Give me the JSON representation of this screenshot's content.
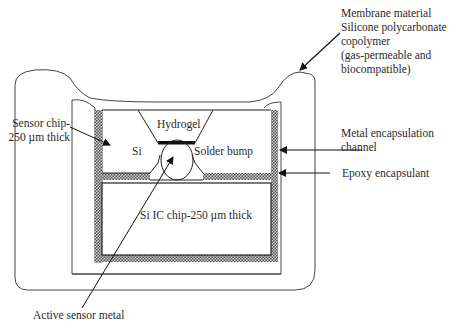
{
  "diagram": {
    "type": "cross-section schematic of encapsulated implantable sensor",
    "labels": {
      "membrane": [
        "Membrane material",
        "Silicone polycarbonate",
        "copolymer",
        "(gas-permeable and",
        "biocompatible)"
      ],
      "sensor_chip": [
        "Sensor chip-",
        "250 µm thick"
      ],
      "metal_channel": [
        "Metal encapsulation",
        "channel"
      ],
      "epoxy": "Epoxy encapsulant",
      "active_metal": "Active sensor metal"
    },
    "inner_labels": {
      "hydrogel": "Hydrogel",
      "si": "Si",
      "solder": "Solder bump",
      "ic_chip": "Si IC chip-250 µm thick"
    },
    "colors": {
      "line": "#222222",
      "hatch_dark": "#555555",
      "hatch_light": "#cfcfcf",
      "background": "#ffffff"
    }
  }
}
